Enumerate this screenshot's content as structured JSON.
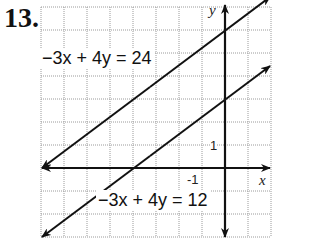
{
  "problem_number": "13.",
  "graph": {
    "x_axis_label": "x",
    "y_axis_label": "y",
    "tick_labels": {
      "x": "-1",
      "y": "1"
    },
    "grid": {
      "x_min": -8,
      "x_max": 2,
      "y_min": -3,
      "y_max": 7,
      "unit": 1
    },
    "lines": [
      {
        "equation": "−3x + 4y = 24",
        "slope": 0.75,
        "y_intercept": 6
      },
      {
        "equation": "−3x + 4y = 12",
        "slope": 0.75,
        "y_intercept": 3
      }
    ]
  }
}
